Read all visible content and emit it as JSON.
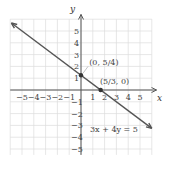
{
  "chart_data": {
    "type": "line",
    "title": "",
    "xlabel": "x",
    "ylabel": "y",
    "xlim": [
      -6,
      6
    ],
    "ylim": [
      -5.5,
      6
    ],
    "grid": true,
    "x_ticks": [
      "-5",
      "-4",
      "-3",
      "-2",
      "-1",
      "1",
      "2",
      "3",
      "4",
      "5"
    ],
    "y_ticks": [
      "5",
      "4",
      "3",
      "2",
      "1",
      "-1",
      "-2",
      "-3",
      "-4",
      "-5"
    ],
    "series": [
      {
        "name": "3x + 4y = 5",
        "equation": "3x + 4y = 5",
        "x": [
          -5.9,
          6.0
        ],
        "y": [
          5.675,
          -3.25
        ],
        "color": "#555555"
      }
    ],
    "points": [
      {
        "label": "(0, 5/4)",
        "x": 0,
        "y": 1.25
      },
      {
        "label": "(5/3, 0)",
        "x": 1.6667,
        "y": 0
      }
    ],
    "annotations": [
      "(0, 5/4)",
      "(5/3, 0)",
      "3x + 4y = 5"
    ]
  },
  "labels": {
    "x_axis": "x",
    "y_axis": "y",
    "equation": "3x + 4y = 5",
    "point_a": "(0, 5/4)",
    "point_b": "(5/3, 0)"
  }
}
